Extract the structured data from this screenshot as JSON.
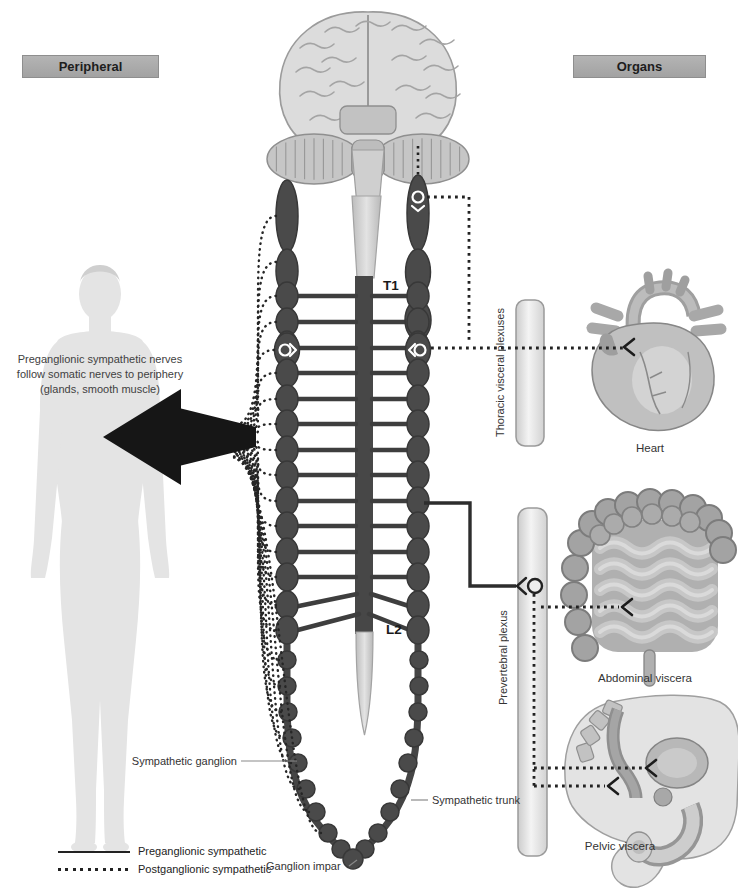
{
  "headers": {
    "peripheral": "Peripheral",
    "organs": "Organs"
  },
  "annotation": {
    "line1": "Preganglionic sympathetic nerves",
    "line2": "follow somatic nerves to periphery",
    "line3": "(glands, smooth muscle)"
  },
  "cord_labels": {
    "t1": "T1",
    "l2": "L2"
  },
  "plexus_labels": {
    "thoracic": "Thoracic visceral plexuses",
    "prevertebral": "Prevertebral plexus"
  },
  "organ_labels": {
    "heart": "Heart",
    "abdominal": "Abdominal viscera",
    "pelvic": "Pelvic viscera"
  },
  "trunk_labels": {
    "sympathetic_ganglion": "Sympathetic ganglion",
    "sympathetic_trunk": "Sympathetic trunk",
    "ganglion_impar": "Ganglion impar"
  },
  "legend": {
    "preganglionic": "Preganglionic sympathetic",
    "postganglionic": "Postganglionic sympathetic"
  },
  "colors": {
    "dark_structure": "#4a4a4a",
    "line_dark": "#262626",
    "header_bg": "#a9a9a9",
    "bar_fill": "#ededed",
    "figure_silhouette": "#e4e4e4"
  }
}
